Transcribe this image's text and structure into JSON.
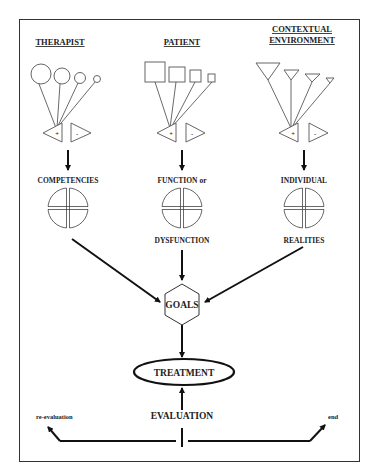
{
  "diagram": {
    "columns": [
      {
        "heading": [
          "THERAPIST"
        ],
        "shape_type": "circle",
        "sign_plus": "+",
        "sign_minus": "-",
        "label_top": "COMPETENCIES",
        "label_bottom": ""
      },
      {
        "heading": [
          "PATIENT"
        ],
        "shape_type": "square",
        "sign_plus": "+",
        "sign_minus": "-",
        "label_top": "FUNCTION or",
        "label_bottom": "DYSFUNCTION"
      },
      {
        "heading": [
          "CONTEXTUAL",
          "ENVIRONMENT"
        ],
        "shape_type": "triangle",
        "sign_plus": "+",
        "sign_minus": "-",
        "label_top": "INDIVIDUAL",
        "label_bottom": "REALITIES"
      }
    ],
    "goals_label": "GOALS",
    "treatment_label": "TREATMENT",
    "evaluation_label": "EVALUATION",
    "reevaluation_label": "re-evaluation",
    "end_label": "end"
  },
  "colors": {
    "background": "#ffffff",
    "line": "#111111",
    "text": "#222222"
  }
}
